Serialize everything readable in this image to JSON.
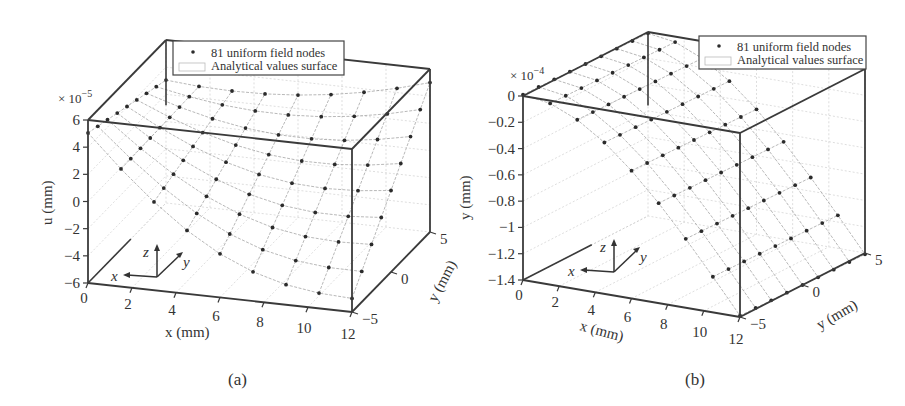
{
  "chart_data": [
    {
      "id": "a",
      "type": "surface3d",
      "caption": "(a)",
      "title": "",
      "xlabel": "x (mm)",
      "ylabel": "y (mm)",
      "zlabel": "u (mm)",
      "z_multiplier": "× 10",
      "z_exponent": "−5",
      "xlim": [
        0,
        12
      ],
      "ylim": [
        -5,
        5
      ],
      "zlim": [
        -6,
        6
      ],
      "x_ticks": [
        "0",
        "2",
        "4",
        "6",
        "8",
        "10",
        "12"
      ],
      "y_ticks": [
        "−5",
        "0",
        "5"
      ],
      "z_ticks": [
        "−6",
        "−4",
        "−2",
        "0",
        "2",
        "4",
        "6"
      ],
      "grid": true,
      "legend": {
        "position": "upper-center",
        "entries": [
          {
            "marker": "dot",
            "label": "81 uniform field nodes"
          },
          {
            "marker": "surface",
            "label": "Analytical values surface"
          }
        ]
      },
      "triad": {
        "x": "x",
        "y": "y",
        "z": "z"
      },
      "nodes_grid": {
        "nx": 9,
        "ny": 9,
        "count": 81
      },
      "series": [
        {
          "name": "81 uniform field nodes",
          "kind": "scatter",
          "description": "u displacement at 9×9 nodes; u rises toward +x/+y corner (~+5e-5) and dips near x≈6–12, y=−5 (~−5e-5)"
        },
        {
          "name": "Analytical values surface",
          "kind": "surface"
        }
      ]
    },
    {
      "id": "b",
      "type": "surface3d",
      "caption": "(b)",
      "title": "",
      "xlabel": "x (mm)",
      "ylabel": "y (mm)",
      "zlabel": "y (mm)",
      "z_multiplier": "× 10",
      "z_exponent": "−4",
      "xlim": [
        0,
        12
      ],
      "ylim": [
        -5,
        5
      ],
      "zlim": [
        -1.4,
        0
      ],
      "x_ticks": [
        "0",
        "2",
        "4",
        "6",
        "8",
        "10",
        "12"
      ],
      "y_ticks": [
        "−5",
        "0",
        "5"
      ],
      "z_ticks": [
        "−1.4",
        "−1.2",
        "−1",
        "−0.8",
        "−0.6",
        "−0.4",
        "−0.2",
        "0"
      ],
      "grid": true,
      "legend": {
        "position": "upper-right",
        "entries": [
          {
            "marker": "dot",
            "label": "81 uniform field nodes"
          },
          {
            "marker": "surface",
            "label": "Analytical values surface"
          }
        ]
      },
      "triad": {
        "x": "x",
        "y": "y",
        "z": "z"
      },
      "nodes_grid": {
        "nx": 9,
        "ny": 9,
        "count": 81
      },
      "series": [
        {
          "name": "81 uniform field nodes",
          "kind": "scatter",
          "description": "deflection at 9×9 nodes; 0 at x=0 decreasing parabolically to ~−1.4e-4 at x=12, nearly constant in y"
        },
        {
          "name": "Analytical values surface",
          "kind": "surface"
        }
      ]
    }
  ],
  "layout": {
    "a": {
      "fl_bottom": [
        88,
        283
      ],
      "fr_bottom": [
        352,
        312
      ],
      "br_bottom": [
        430,
        232
      ],
      "z_top_offset": -163,
      "bl_top": [
        170,
        31
      ]
    },
    "b": {
      "fl_bottom": [
        523,
        280
      ],
      "fr_bottom": [
        740,
        317
      ],
      "br_bottom": [
        865,
        253
      ],
      "z_top_offset": -184,
      "bl_top": [
        650,
        33
      ]
    }
  },
  "colors": {
    "axis": "#3a3a3a",
    "grid": "#c8c8c8",
    "mesh": "#9a9a9a",
    "node": "#2b2b2b",
    "text": "#333333"
  }
}
